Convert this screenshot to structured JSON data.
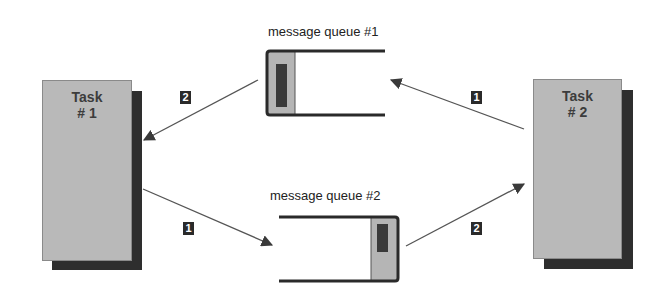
{
  "tasks": [
    {
      "title": "Task",
      "number": "# 1"
    },
    {
      "title": "Task",
      "number": "# 2"
    }
  ],
  "queues": [
    {
      "label": "message queue  #1"
    },
    {
      "label": "message queue  #2"
    }
  ],
  "arrows": [
    {
      "from": "message queue #1",
      "to": "Task #1",
      "step": "2"
    },
    {
      "from": "Task #2",
      "to": "message queue #1",
      "step": "1"
    },
    {
      "from": "Task #1",
      "to": "message queue #2",
      "step": "1"
    },
    {
      "from": "message queue #2",
      "to": "Task #2",
      "step": "2"
    }
  ],
  "colors": {
    "task_fill": "#b9b9b9",
    "task_shadow": "#2e2e2e",
    "queue_slot": "#b5b5b5",
    "queue_item": "#3a3a3a",
    "arrow": "#555555",
    "badge": "#2a2a2a"
  }
}
